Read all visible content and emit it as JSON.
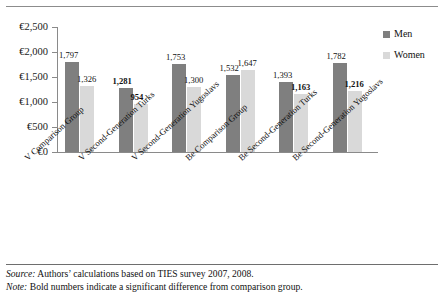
{
  "chart_data": {
    "type": "bar",
    "title": "",
    "xlabel": "",
    "ylabel": "",
    "ylim": [
      0,
      2500
    ],
    "ytick_labels": [
      "€2,500",
      "€2,000",
      "€1,500",
      "€1,000",
      "€500",
      "€0"
    ],
    "ytick_values": [
      2500,
      2000,
      1500,
      1000,
      500,
      0
    ],
    "grid": false,
    "legend_position": "right-top",
    "categories": [
      "V Comparison Group",
      "V Second-Generation Turks",
      "V Second-Generation Yugoslavs",
      "Be Comparison Group",
      "Be Second-Generation Turks",
      "Be Second-Generation Yugoslavs"
    ],
    "series": [
      {
        "name": "Men",
        "color": "#7f7f7f",
        "values": [
          1797,
          1281,
          1753,
          1532,
          1393,
          1782
        ],
        "labels": [
          "1,797",
          "1,281",
          "1,753",
          "1,532",
          "1,393",
          "1,782"
        ],
        "bold": [
          false,
          true,
          false,
          false,
          false,
          false
        ]
      },
      {
        "name": "Women",
        "color": "#d9d9d9",
        "values": [
          1326,
          954,
          1300,
          1647,
          1163,
          1216
        ],
        "labels": [
          "1,326",
          "954",
          "1,300",
          "1,647",
          "1,163",
          "1,216"
        ],
        "bold": [
          false,
          true,
          false,
          false,
          true,
          true
        ]
      }
    ]
  },
  "legend": {
    "items": [
      {
        "label": "Men",
        "color": "#7f7f7f"
      },
      {
        "label": "Women",
        "color": "#d9d9d9"
      }
    ]
  },
  "footer": {
    "source_prefix": "Source:",
    "source_text": " Authors’ calculations based on TIES survey 2007, 2008.",
    "note_prefix": "Note:",
    "note_text": " Bold numbers indicate a significant difference from comparison group."
  }
}
